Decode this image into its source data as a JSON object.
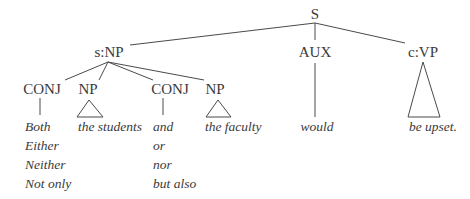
{
  "diagram": {
    "type": "syntax-tree",
    "root": {
      "label": "S"
    },
    "nodes": {
      "subject": {
        "label": "s:NP"
      },
      "aux": {
        "label": "AUX"
      },
      "vp": {
        "label": "c:VP"
      },
      "conj1": {
        "label": "CONJ"
      },
      "np1": {
        "label": "NP"
      },
      "conj2": {
        "label": "CONJ"
      },
      "np2": {
        "label": "NP"
      }
    },
    "leaves": {
      "conj1_options": [
        "Both",
        "Either",
        "Neither",
        "Not only"
      ],
      "np1": "the students",
      "conj2_options": [
        "and",
        "or",
        "nor",
        "but also"
      ],
      "np2": "the faculty",
      "aux": "would",
      "vp": "be upset."
    },
    "colors": {
      "text": "#3a3a3a",
      "lines": "#4a4a4a",
      "background": "#ffffff"
    }
  }
}
